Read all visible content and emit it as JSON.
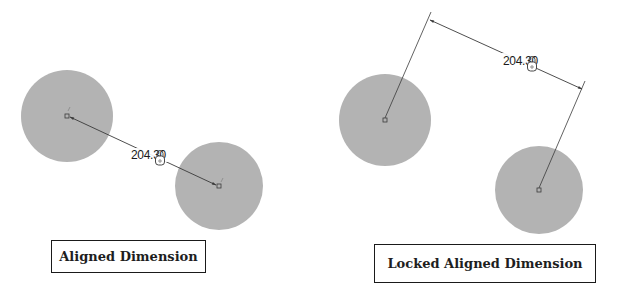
{
  "colors": {
    "circle_fill": "#b3b3b3",
    "line": "#3a3a3a",
    "text": "#1a1a1a",
    "background": "#ffffff"
  },
  "left_panel": {
    "caption": "Aligned Dimension",
    "dimension_value": "204.30",
    "lock_icon": "lock-icon",
    "circles": [
      {
        "cx": 67,
        "cy": 116,
        "r": 46
      },
      {
        "cx": 219,
        "cy": 186,
        "r": 44
      }
    ]
  },
  "right_panel": {
    "caption": "Locked Aligned Dimension",
    "dimension_value": "204.30",
    "lock_icon": "lock-icon",
    "circles": [
      {
        "cx": 385,
        "cy": 120,
        "r": 46
      },
      {
        "cx": 539,
        "cy": 190,
        "r": 44
      }
    ]
  }
}
